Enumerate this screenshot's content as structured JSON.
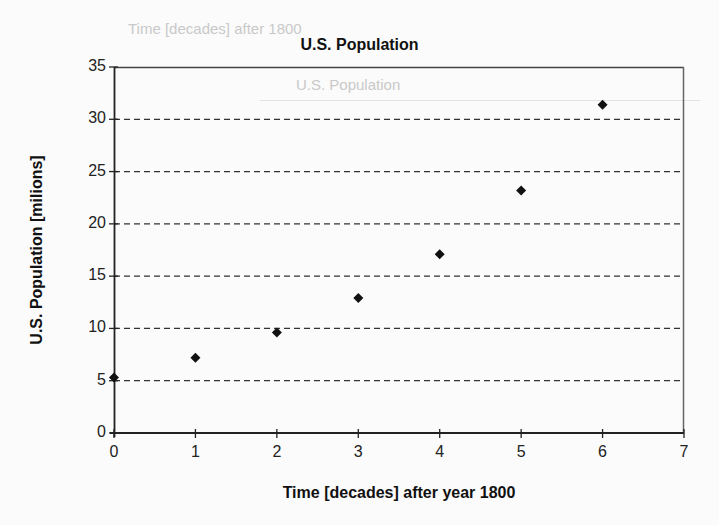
{
  "chart_data": {
    "type": "scatter",
    "title": "U.S. Population",
    "xlabel": "Time [decades] after year 1800",
    "ylabel": "U.S. Population [milions]",
    "x": [
      0,
      1,
      2,
      3,
      4,
      5,
      6
    ],
    "series": [
      {
        "name": "U.S. Population",
        "marker": "diamond",
        "values": [
          5.3,
          7.2,
          9.6,
          12.9,
          17.1,
          23.2,
          31.4
        ]
      }
    ],
    "xlim": [
      0,
      7
    ],
    "ylim": [
      0,
      35
    ],
    "xticks": [
      "0",
      "1",
      "2",
      "3",
      "4",
      "5",
      "6",
      "7"
    ],
    "yticks": [
      "0",
      "5",
      "10",
      "15",
      "20",
      "25",
      "30",
      "35"
    ],
    "grid": {
      "horizontal": true,
      "style": "dashed",
      "vertical": false
    },
    "legend": "none"
  },
  "ghost_text": {
    "top": "Time [decades] after 1800",
    "mid": "U.S. Population"
  },
  "colors": {
    "marker": "#111111",
    "axis": "#222222",
    "grid": "#333333",
    "border_top": "#444444",
    "border_right": "#666666"
  }
}
